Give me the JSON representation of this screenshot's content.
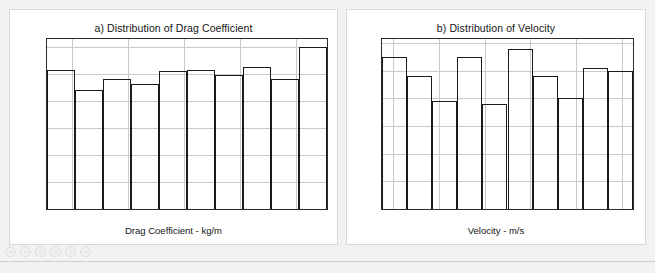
{
  "page": {
    "background_color": "#f2f2f2",
    "panel_background": "#ffffff",
    "axis_color": "#1a1a1a",
    "grid_color": "#c9c9c9"
  },
  "toolbar": {
    "icons": [
      "home-icon",
      "forward-icon",
      "pan-icon",
      "zoom-icon",
      "settings-icon",
      "minus-icon"
    ]
  },
  "chart_data": [
    {
      "type": "bar",
      "id": "drag-coefficient-histogram",
      "title": "a) Distribution of Drag Coefficient",
      "xlabel": "Drag Coefficient - kg/m",
      "ylabel": "",
      "grid": true,
      "legend": "none",
      "xlim": [
        0.2255,
        0.2755
      ],
      "ylim": [
        0,
        126
      ],
      "xticks": [
        0.23,
        0.24,
        0.25,
        0.26,
        0.27
      ],
      "xticklabels": [
        "0.23",
        "0.24",
        "0.25",
        "0.26",
        "0.27"
      ],
      "yticks": [
        0,
        20,
        40,
        60,
        80,
        100,
        120
      ],
      "yticklabels": [
        "0",
        "20",
        "40",
        "60",
        "80",
        "100",
        "120"
      ],
      "bin_edges": [
        0.2255,
        0.2305,
        0.2355,
        0.2405,
        0.2455,
        0.2505,
        0.2555,
        0.2605,
        0.2655,
        0.2705,
        0.2755
      ],
      "categories": [
        "0.2255-0.2305",
        "0.2305-0.2355",
        "0.2355-0.2405",
        "0.2405-0.2455",
        "0.2455-0.2505",
        "0.2505-0.2555",
        "0.2555-0.2605",
        "0.2605-0.2655",
        "0.2655-0.2705",
        "0.2705-0.2755"
      ],
      "values": [
        103,
        88,
        96,
        93,
        102,
        103,
        99,
        105,
        96,
        120
      ]
    },
    {
      "type": "bar",
      "id": "velocity-histogram",
      "title": "b) Distribution of Velocity",
      "xlabel": "Velocity - m/s",
      "ylabel": "",
      "grid": true,
      "legend": "none",
      "xlim": [
        33.075,
        33.625
      ],
      "ylim": [
        0,
        61.5
      ],
      "xticks": [
        33.1,
        33.2,
        33.3,
        33.4,
        33.5,
        33.6
      ],
      "xticklabels": [
        "33.1",
        "33.2",
        "33.3",
        "33.4",
        "33.5",
        "33.6"
      ],
      "yticks": [
        0,
        10,
        20,
        30,
        40,
        50,
        60
      ],
      "yticklabels": [
        "0",
        "10",
        "20",
        "30",
        "40",
        "50",
        "60"
      ],
      "bin_edges": [
        33.075,
        33.13,
        33.185,
        33.24,
        33.295,
        33.35,
        33.405,
        33.46,
        33.515,
        33.57,
        33.625
      ],
      "categories": [
        "33.075-33.13",
        "33.13-33.185",
        "33.185-33.24",
        "33.24-33.295",
        "33.295-33.35",
        "33.35-33.405",
        "33.405-33.46",
        "33.46-33.515",
        "33.515-33.57",
        "33.57-33.625"
      ],
      "values": [
        55,
        48,
        39,
        55,
        38,
        58,
        48,
        40,
        51,
        50
      ]
    }
  ]
}
